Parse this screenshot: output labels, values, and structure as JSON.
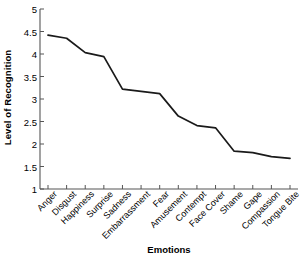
{
  "chart_data": {
    "type": "line",
    "title": "",
    "xlabel": "Emotions",
    "ylabel": "Level of Recognition",
    "categories": [
      "Anger",
      "Disgust",
      "Happiness",
      "Surprise",
      "Sadness",
      "Embarrassment",
      "Fear",
      "Amusement",
      "Contempt",
      "Face Cover",
      "Shame",
      "Gape",
      "Compassion",
      "Tongue Bite"
    ],
    "values": [
      4.42,
      4.35,
      4.03,
      3.94,
      3.22,
      3.17,
      3.12,
      2.62,
      2.41,
      2.36,
      1.84,
      1.81,
      1.72,
      1.68
    ],
    "ylim": [
      1,
      5
    ],
    "yticks": [
      1,
      1.5,
      2,
      2.5,
      3,
      3.5,
      4,
      4.5,
      5
    ],
    "ytick_labels": [
      "1",
      "1.5",
      "2",
      "2.5",
      "3",
      "3.5",
      "4",
      "4.5",
      "5"
    ],
    "grid": false,
    "legend": false,
    "line_color": "#1a1a1a",
    "line_width": 1.7,
    "markers": false,
    "axis_color": "#555555",
    "background": "#ffffff"
  }
}
